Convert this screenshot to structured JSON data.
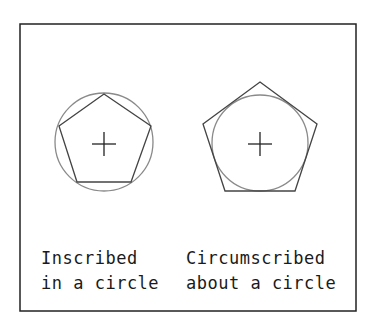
{
  "diagram": {
    "colors": {
      "frame": "#222222",
      "polygon": "#444444",
      "circle": "#8a8a8a",
      "text": "#1a1a1a"
    },
    "left": {
      "label_line1": "Inscribed",
      "label_line2": "in a circle"
    },
    "right": {
      "label_line1": "Circumscribed",
      "label_line2": "about a circle"
    }
  }
}
